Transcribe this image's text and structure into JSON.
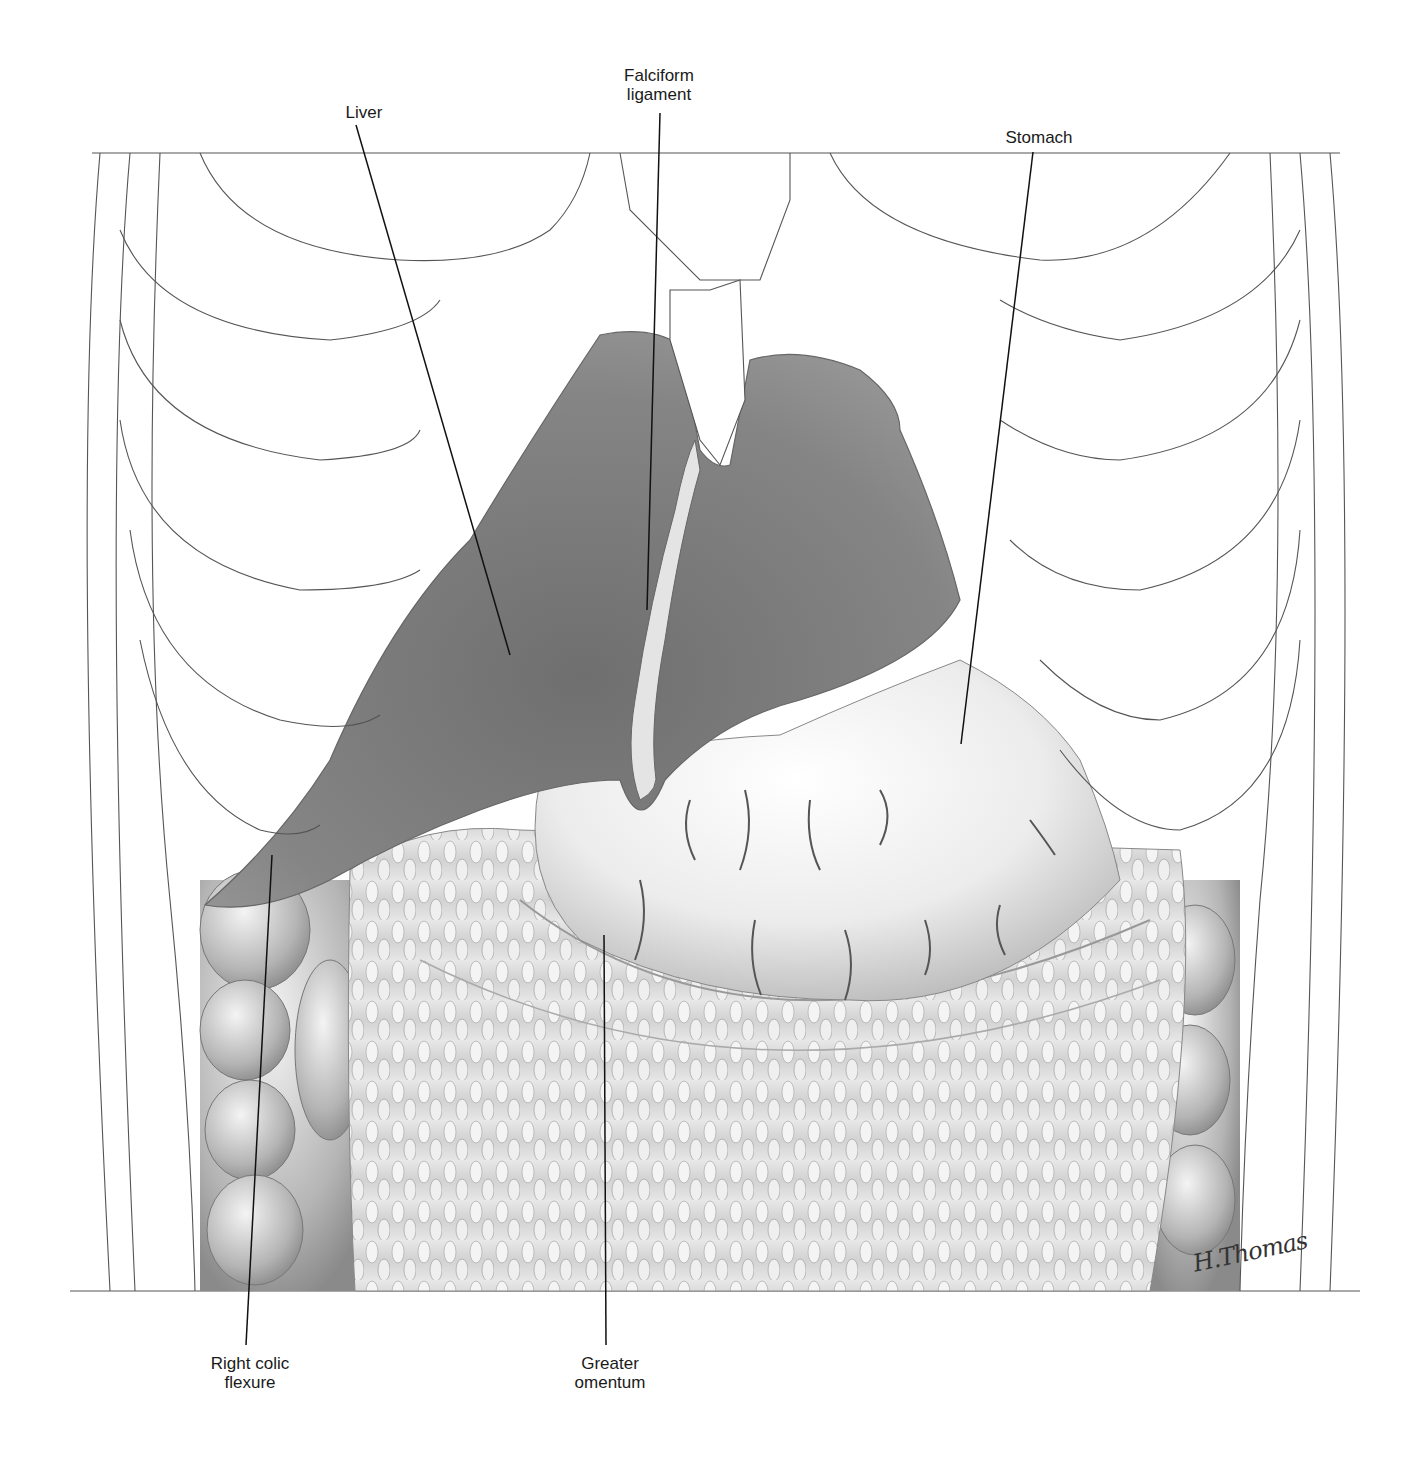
{
  "figure": {
    "type": "anatomical-illustration",
    "frame": {
      "top_y": 153,
      "bottom_y": 1291,
      "left_x": 92,
      "right_x": 1340
    },
    "colors": {
      "background": "#ffffff",
      "outline": "#555555",
      "leader": "#111111",
      "liver": "#7a7a7a",
      "liver_dark": "#5e5e5e",
      "stomach": "#eeeeee",
      "omentum": "#d6d6d6",
      "colon": "#bdbdbd",
      "ligament": "#e4e4e4"
    }
  },
  "labels": [
    {
      "id": "liver",
      "text": "Liver",
      "x": 334,
      "y": 103,
      "width": 60,
      "leader": {
        "x1": 356,
        "y1": 125,
        "x2": 510,
        "y2": 655
      }
    },
    {
      "id": "falciform-ligament",
      "text": "Falciform\nligament",
      "x": 604,
      "y": 66,
      "width": 110,
      "leader": {
        "x1": 660,
        "y1": 113,
        "x2": 647,
        "y2": 610
      }
    },
    {
      "id": "stomach",
      "text": "Stomach",
      "x": 994,
      "y": 128,
      "width": 90,
      "leader": {
        "x1": 1033,
        "y1": 152,
        "x2": 961,
        "y2": 744
      }
    },
    {
      "id": "right-colic-flexure",
      "text": "Right colic\nflexure",
      "x": 190,
      "y": 1354,
      "width": 120,
      "leader": {
        "x1": 246,
        "y1": 1345,
        "x2": 272,
        "y2": 855
      }
    },
    {
      "id": "greater-omentum",
      "text": "Greater\nomentum",
      "x": 560,
      "y": 1354,
      "width": 100,
      "leader": {
        "x1": 606,
        "y1": 1345,
        "x2": 604,
        "y2": 935
      }
    }
  ],
  "signature": {
    "text": "H.Thomas",
    "x": 1192,
    "y": 1238
  }
}
